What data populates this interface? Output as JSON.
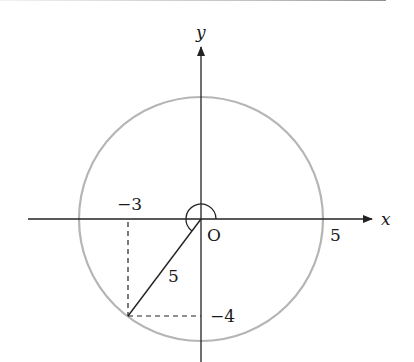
{
  "diagram": {
    "type": "unit-circle-angle",
    "axes": {
      "x_label": "x",
      "y_label": "y",
      "origin_label": "O"
    },
    "circle": {
      "radius_value": 5,
      "stroke_color": "#b5b5b5"
    },
    "point": {
      "x": -3,
      "y": -4
    },
    "labels": {
      "x_coord": "−3",
      "y_coord": "−4",
      "radius_segment": "5",
      "x_intercept": "5"
    },
    "colors": {
      "axis": "#222222",
      "dashed": "#222222",
      "circle": "#b5b5b5"
    }
  }
}
